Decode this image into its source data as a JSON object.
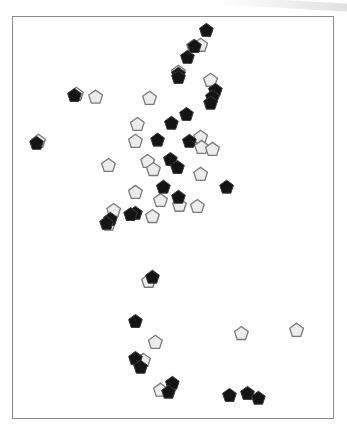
{
  "chart_data": {
    "type": "scatter",
    "title": "",
    "xlabel": "",
    "ylabel": "",
    "xlim": [
      0,
      100
    ],
    "ylim": [
      0,
      100
    ],
    "grid": false,
    "legend": "none",
    "marker": "pentagon",
    "series": [
      {
        "name": "dark",
        "color": "#141414",
        "points": [
          [
            60.4,
            96.5
          ],
          [
            56.7,
            92.5
          ],
          [
            54.5,
            89.8
          ],
          [
            51.7,
            85.6
          ],
          [
            51.7,
            84.8
          ],
          [
            63.2,
            81.6
          ],
          [
            62.3,
            79.9
          ],
          [
            61.7,
            78.4
          ],
          [
            54.2,
            75.6
          ],
          [
            49.5,
            73.4
          ],
          [
            45.2,
            69.2
          ],
          [
            55.1,
            68.9
          ],
          [
            7.5,
            68.4
          ],
          [
            49.2,
            64.4
          ],
          [
            51.4,
            62.4
          ],
          [
            47.0,
            57.5
          ],
          [
            51.7,
            55.0
          ],
          [
            66.7,
            57.5
          ],
          [
            38.3,
            51.0
          ],
          [
            36.8,
            50.7
          ],
          [
            30.5,
            49.5
          ],
          [
            29.3,
            48.5
          ],
          [
            43.6,
            35.1
          ],
          [
            38.3,
            24.1
          ],
          [
            38.3,
            14.9
          ],
          [
            39.9,
            12.7
          ],
          [
            49.8,
            8.7
          ],
          [
            48.6,
            6.5
          ],
          [
            67.6,
            5.7
          ],
          [
            73.2,
            6.2
          ],
          [
            76.6,
            5.0
          ],
          [
            19.3,
            80.3
          ]
        ]
      },
      {
        "name": "light",
        "color": "#ececec",
        "points": [
          [
            56.4,
            92.5
          ],
          [
            58.6,
            92.8
          ],
          [
            51.7,
            86.1
          ],
          [
            61.7,
            84.1
          ],
          [
            25.9,
            79.9
          ],
          [
            42.7,
            79.6
          ],
          [
            19.9,
            80.6
          ],
          [
            38.9,
            73.1
          ],
          [
            38.3,
            68.9
          ],
          [
            29.9,
            62.9
          ],
          [
            42.1,
            63.9
          ],
          [
            43.9,
            61.9
          ],
          [
            58.6,
            69.9
          ],
          [
            58.9,
            67.4
          ],
          [
            62.3,
            66.9
          ],
          [
            58.6,
            60.7
          ],
          [
            38.3,
            56.2
          ],
          [
            46.1,
            54.2
          ],
          [
            52.0,
            53.0
          ],
          [
            57.6,
            52.7
          ],
          [
            43.6,
            50.2
          ],
          [
            31.5,
            51.7
          ],
          [
            29.9,
            48.3
          ],
          [
            42.4,
            34.1
          ],
          [
            44.5,
            18.9
          ],
          [
            71.3,
            21.1
          ],
          [
            88.5,
            21.9
          ],
          [
            40.8,
            14.4
          ],
          [
            46.1,
            7.0
          ],
          [
            8.1,
            68.9
          ]
        ]
      }
    ]
  }
}
